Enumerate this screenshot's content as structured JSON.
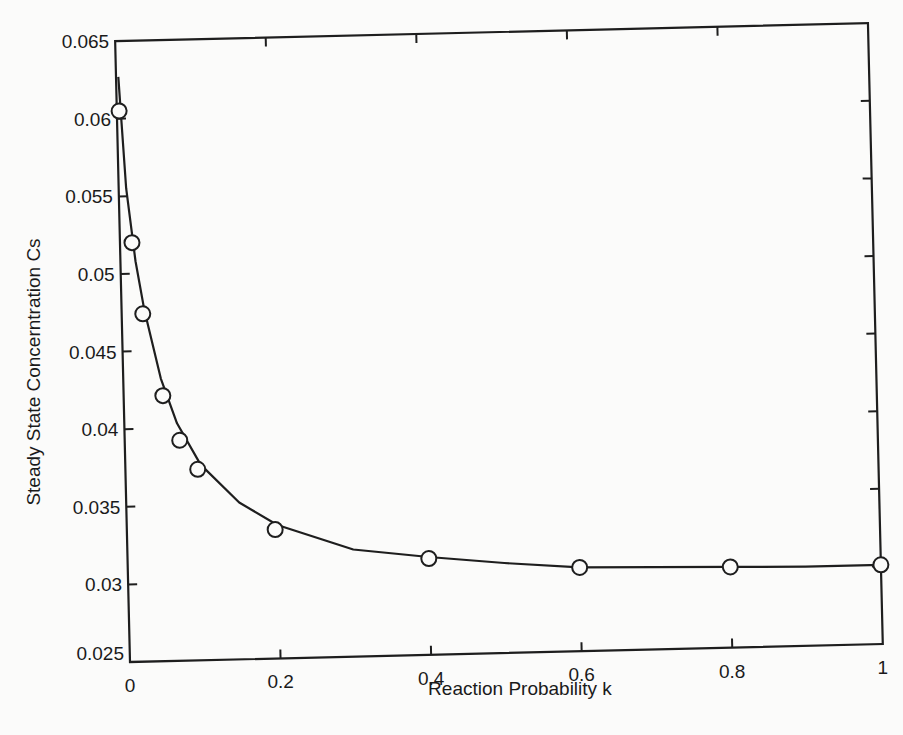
{
  "chart_data": {
    "type": "line",
    "title": "",
    "xlabel": "Reaction Probability k",
    "ylabel": "Steady State Concerntration Cs",
    "xlim": [
      0,
      1
    ],
    "ylim": [
      0.025,
      0.065
    ],
    "grid": false,
    "legend": null,
    "x_ticks": [
      0,
      0.2,
      0.4,
      0.6,
      0.8,
      1
    ],
    "x_tick_labels": [
      "0",
      "0.2",
      "0.4",
      "0.6",
      "0.8",
      "1"
    ],
    "y_ticks": [
      0.025,
      0.03,
      0.035,
      0.04,
      0.045,
      0.05,
      0.055,
      0.06,
      0.065
    ],
    "y_tick_labels": [
      "0.025",
      "0.03",
      "0.035",
      "0.04",
      "0.045",
      "0.05",
      "0.055",
      "0.06",
      "0.065"
    ],
    "series": [
      {
        "name": "simulation",
        "style": "markers",
        "marker": "open-circle",
        "x": [
          0.003,
          0.016,
          0.028,
          0.052,
          0.073,
          0.096,
          0.197,
          0.4,
          0.6,
          0.8,
          1.0
        ],
        "y": [
          0.0605,
          0.052,
          0.0474,
          0.0421,
          0.0392,
          0.0373,
          0.0333,
          0.0312,
          0.0304,
          0.0302,
          0.0301
        ]
      },
      {
        "name": "model",
        "style": "line",
        "x": [
          0.003,
          0.01,
          0.02,
          0.03,
          0.05,
          0.07,
          0.1,
          0.15,
          0.2,
          0.3,
          0.4,
          0.5,
          0.6,
          0.7,
          0.8,
          0.9,
          1.0
        ],
        "y": [
          0.0627,
          0.0555,
          0.0508,
          0.0477,
          0.0432,
          0.0403,
          0.0376,
          0.0351,
          0.0336,
          0.0319,
          0.0313,
          0.0308,
          0.0304,
          0.0303,
          0.0302,
          0.0301,
          0.0301
        ]
      }
    ]
  }
}
